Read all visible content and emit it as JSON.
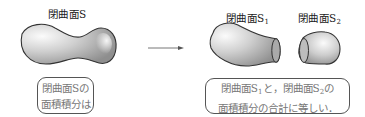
{
  "left": {
    "title": "閉曲面S",
    "caption_line1": "閉曲面Sの",
    "caption_line2": "面積積分は"
  },
  "arrow": {
    "icon": "right-arrow-icon"
  },
  "right": {
    "s1_label_main": "閉曲面S",
    "s1_label_sub": "1",
    "s2_label_main": "閉曲面S",
    "s2_label_sub": "2",
    "caption_line1_a": "閉曲面S",
    "caption_line1_sub1": "1",
    "caption_line1_b": "と，閉曲面S",
    "caption_line1_sub2": "2",
    "caption_line1_c": "の",
    "caption_line2": "面積積分の合計に等しい．"
  },
  "colors": {
    "outline": "#333333",
    "shape_light": "#f2f2f2",
    "shape_dark": "#9a9a9a",
    "box_border": "#555555",
    "box_text": "#777777"
  }
}
